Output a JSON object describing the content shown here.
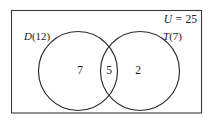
{
  "diagram": {
    "type": "venn-two-set",
    "universe": {
      "symbol": "U",
      "equals": "=",
      "total": "25",
      "label": "U = 25"
    },
    "sets": [
      {
        "id": "left",
        "symbol": "D",
        "count": "(12)",
        "label": "D(12)",
        "total": 12
      },
      {
        "id": "right",
        "symbol": "T",
        "count": "(7)",
        "label": "T(7)",
        "total": 7
      }
    ],
    "regions": [
      {
        "id": "left-only",
        "value": "7"
      },
      {
        "id": "intersection",
        "value": "5"
      },
      {
        "id": "right-only",
        "value": "2"
      }
    ],
    "colors": {
      "background": "#ffffff",
      "rect_stroke": "#3a3a3a",
      "circle_stroke": "#2b2b2b",
      "text": "#1a1a1a"
    }
  }
}
